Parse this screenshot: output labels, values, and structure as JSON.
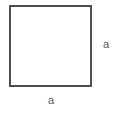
{
  "figure": {
    "type": "geometry-diagram",
    "shape": "square",
    "background_color": "#ffffff",
    "stroke_color": "#4f4f4f",
    "stroke_width": 2,
    "label_color": "#555555",
    "square": {
      "x": 10,
      "y": 6,
      "width": 81,
      "height": 80
    },
    "labels": {
      "right_side": "a",
      "bottom_side": "a"
    }
  }
}
